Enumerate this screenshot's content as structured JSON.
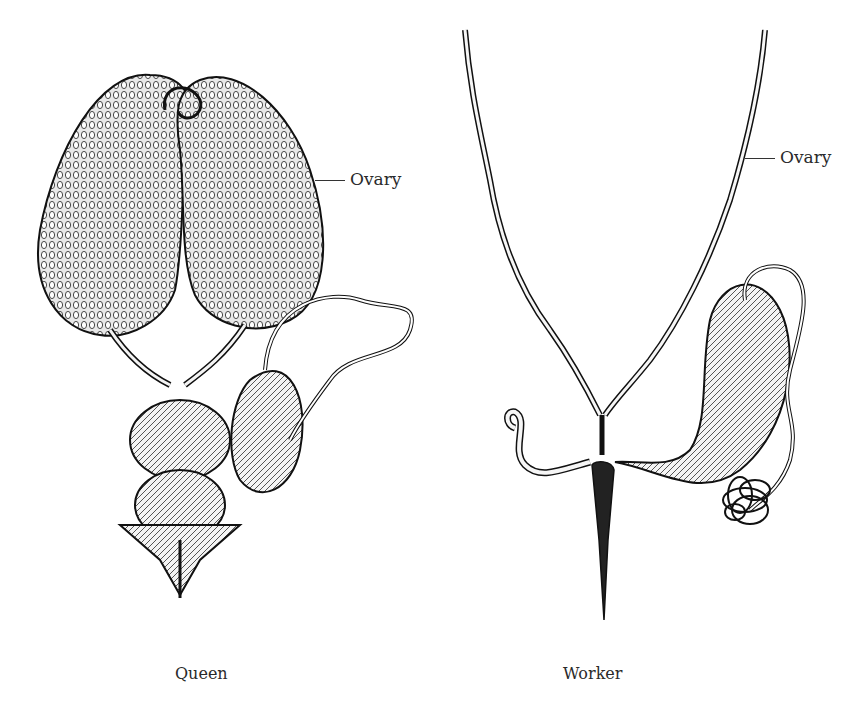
{
  "figures": [
    {
      "id": "queen",
      "caption": "Queen",
      "labels": [
        {
          "text": "Ovary"
        }
      ]
    },
    {
      "id": "worker",
      "caption": "Worker",
      "labels": [
        {
          "text": "Ovary"
        }
      ]
    }
  ],
  "colors": {
    "ink": "#1a1a1a",
    "paper": "#ffffff",
    "fill": "#f2f2f2"
  }
}
